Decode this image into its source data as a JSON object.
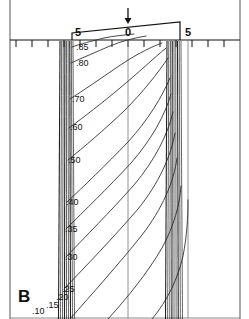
{
  "figure": {
    "panel_label": "B",
    "colors": {
      "ink": "#111111",
      "contour": "#333333",
      "frame": "#555555",
      "background": "#ffffff"
    }
  },
  "axis": {
    "orientation": "horizontal-top",
    "tick_labels": [
      {
        "text": "5",
        "x": 78
      },
      {
        "text": "0",
        "x": 128
      },
      {
        "text": "5",
        "x": 188
      }
    ],
    "tick_spacing_px": 16,
    "tick_count": 15,
    "marker": {
      "name": "down-arrow-marker",
      "x": 128,
      "glyph": "arrow-down"
    }
  },
  "contour_labels": [
    {
      "text": ".85",
      "x": 76,
      "y": 50
    },
    {
      "text": ".80",
      "x": 76,
      "y": 66
    },
    {
      "text": ".70",
      "x": 72,
      "y": 102
    },
    {
      "text": ".60",
      "x": 70,
      "y": 130
    },
    {
      "text": ".50",
      "x": 68,
      "y": 163
    },
    {
      "text": ".40",
      "x": 66,
      "y": 205
    },
    {
      "text": ".35",
      "x": 65,
      "y": 232
    },
    {
      "text": ".30",
      "x": 65,
      "y": 260
    },
    {
      "text": ".25",
      "x": 62,
      "y": 292
    },
    {
      "text": ".20",
      "x": 56,
      "y": 300
    },
    {
      "text": ".15",
      "x": 46,
      "y": 308
    },
    {
      "text": ".10",
      "x": 32,
      "y": 314
    }
  ],
  "chart_data": {
    "type": "line",
    "title": "",
    "subtitle": "",
    "xlabel": "",
    "ylabel": "",
    "grid": false,
    "legend": null,
    "axis_tick_values": [
      5,
      0,
      5
    ],
    "contour_levels": [
      0.85,
      0.8,
      0.7,
      0.6,
      0.5,
      0.4,
      0.35,
      0.3,
      0.25,
      0.2,
      0.15,
      0.1
    ],
    "annotations": [
      {
        "text": "B",
        "role": "panel-label"
      },
      {
        "text": "arrow-down",
        "role": "axis-center-marker",
        "x": 0
      }
    ],
    "series": [
      {
        "name": "0.85",
        "value": 0.85,
        "path": "M 72,47 C 80,44 92,41 104,38 C 114,36 124,35 134,34"
      },
      {
        "name": "0.80",
        "value": 0.8,
        "path": "M 71,63 C 82,58 96,52 110,46 C 122,41 134,38 146,36"
      },
      {
        "name": "0.70",
        "value": 0.7,
        "path": "M 70,99 C 84,90 100,79 116,68 C 132,57 148,48 162,43"
      },
      {
        "name": "0.60",
        "value": 0.6,
        "path": "M 69,128 C 84,117 102,103 120,88 C 138,73 154,58 166,48"
      },
      {
        "name": "0.50",
        "value": 0.5,
        "path": "M 68,160 C 84,147 104,130 124,111 C 143,92 158,73 168,58"
      },
      {
        "name": "0.40",
        "value": 0.4,
        "path": "M 67,202 C 84,186 106,165 128,142 C 148,120 162,97 170,78"
      },
      {
        "name": "0.35",
        "value": 0.35,
        "path": "M 66,229 C 84,211 108,188 131,163 C 152,139 165,115 171,94"
      },
      {
        "name": "0.30",
        "value": 0.3,
        "path": "M 66,257 C 85,237 110,212 134,185 C 155,160 168,134 173,112"
      },
      {
        "name": "0.25",
        "value": 0.25,
        "path": "M 64,289 C 86,266 113,238 138,209 C 159,183 171,156 175,133"
      },
      {
        "name": "0.20",
        "value": 0.2,
        "path": "M 70,319 C 92,294 118,265 142,235 C 162,209 174,182 177,158"
      },
      {
        "name": "0.15",
        "value": 0.15,
        "path": "M 108,319 C 128,297 148,272 162,248 C 174,226 180,204 181,186"
      },
      {
        "name": "0.10",
        "value": 0.1,
        "path": "M 152,319 C 168,300 178,278 183,256 C 187,236 188,216 188,200"
      }
    ],
    "left_bundle": {
      "name": "left-line-bundle",
      "x_range": [
        60,
        73
      ],
      "line_count": 9,
      "description": "dense near-vertical lines at left edge of trapezoid"
    },
    "right_bundle": {
      "name": "right-line-bundle",
      "x_range": [
        167,
        181
      ],
      "line_count": 9,
      "description": "dense near-vertical lines at right edge of trapezoid"
    },
    "reference_lines": [
      {
        "name": "center-reference-line",
        "x": 128
      },
      {
        "name": "right-reference-line",
        "x": 188
      }
    ],
    "trapezoid": {
      "name": "trapezoid-outline",
      "left_x": 72,
      "right_x": 180,
      "left_top_y": 33,
      "right_top_y": 22,
      "baseline_y": 40
    }
  }
}
